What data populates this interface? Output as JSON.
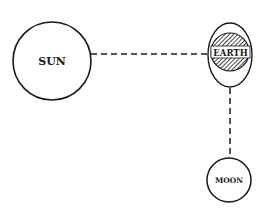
{
  "diagram": {
    "bodies": [
      {
        "id": "sun",
        "label": "SUN"
      },
      {
        "id": "earth",
        "label": "EARTH"
      },
      {
        "id": "moon",
        "label": "MOON"
      }
    ],
    "connections": [
      {
        "from": "sun",
        "to": "earth",
        "style": "dashed"
      },
      {
        "from": "earth",
        "to": "moon",
        "style": "dashed"
      }
    ],
    "colors": {
      "stroke": "#1a1a1a",
      "background": "#ffffff"
    }
  }
}
